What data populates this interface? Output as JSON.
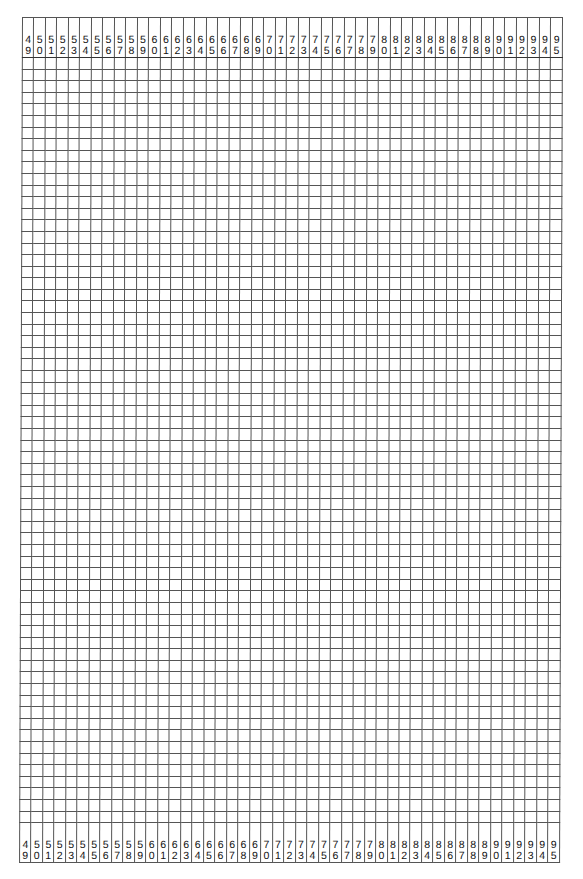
{
  "grid": {
    "columns": [
      "49",
      "50",
      "51",
      "52",
      "53",
      "54",
      "55",
      "56",
      "57",
      "58",
      "59",
      "60",
      "61",
      "62",
      "63",
      "64",
      "65",
      "66",
      "67",
      "68",
      "69",
      "70",
      "71",
      "72",
      "73",
      "74",
      "75",
      "76",
      "77",
      "78",
      "79",
      "80",
      "81",
      "82",
      "83",
      "84",
      "85",
      "86",
      "87",
      "88",
      "89",
      "90",
      "91",
      "92",
      "93",
      "94",
      "95"
    ],
    "row_count": 66,
    "line_color": "#555555",
    "border_color": "#333333"
  }
}
